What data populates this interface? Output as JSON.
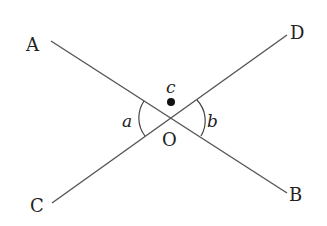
{
  "diagram": {
    "points": {
      "A": {
        "label": "A"
      },
      "B": {
        "label": "B"
      },
      "C": {
        "label": "C"
      },
      "D": {
        "label": "D"
      },
      "O": {
        "label": "O"
      }
    },
    "angles": {
      "a": "a",
      "b": "b",
      "c": "c"
    },
    "lines": [
      {
        "name": "AB",
        "from": "A",
        "to": "B"
      },
      {
        "name": "CD",
        "from": "C",
        "to": "D"
      }
    ],
    "line_color": "#555555",
    "text_color": "#222222"
  }
}
